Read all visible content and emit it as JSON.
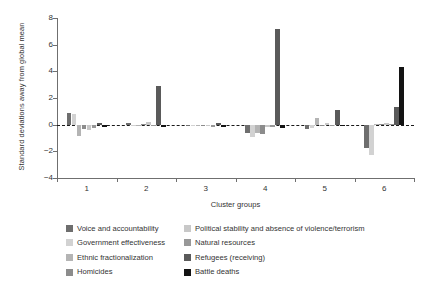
{
  "chart_data": {
    "type": "bar",
    "title": "",
    "xlabel": "Cluster groups",
    "ylabel": "Standard deviations away from global mean",
    "categories": [
      "1",
      "2",
      "3",
      "4",
      "5",
      "6"
    ],
    "ylim": [
      -4,
      8
    ],
    "yticks": [
      8,
      6,
      4,
      2,
      0,
      -2,
      -4
    ],
    "ytick_labels": [
      "8",
      "6",
      "4",
      "2",
      "0",
      "−2",
      "−4"
    ],
    "grid": false,
    "zero_reference_line": true,
    "legend_position": "below",
    "series": [
      {
        "name": "Voice and accountability",
        "color": "#6e6e6e",
        "values": [
          0.9,
          0.12,
          -0.12,
          -0.62,
          -0.36,
          -1.72
        ]
      },
      {
        "name": "Government effectiveness",
        "color": "#d2d2d2",
        "values": [
          0.78,
          -0.08,
          -0.1,
          -0.95,
          -0.22,
          -2.3
        ]
      },
      {
        "name": "Ethnic fractionalization",
        "color": "#b4b4b4",
        "values": [
          -0.82,
          -0.1,
          -0.06,
          -0.62,
          0.5,
          0.05
        ]
      },
      {
        "name": "Homicides",
        "color": "#8c8c8c",
        "values": [
          -0.3,
          0.05,
          -0.05,
          -0.7,
          -0.12,
          0.02
        ]
      },
      {
        "name": "Political stability and absence of violence/terrorism",
        "color": "#c8c8c8",
        "values": [
          -0.38,
          0.22,
          -0.08,
          -0.16,
          0.12,
          0.1
        ]
      },
      {
        "name": "Natural resources",
        "color": "#989898",
        "values": [
          -0.22,
          -0.06,
          -0.14,
          -0.18,
          -0.05,
          0.06
        ]
      },
      {
        "name": "Refugees (receiving)",
        "color": "#5a5a5a",
        "values": [
          0.14,
          2.9,
          0.16,
          7.2,
          1.1,
          1.3
        ]
      },
      {
        "name": "Battle deaths",
        "color": "#131313",
        "values": [
          -0.15,
          -0.14,
          -0.2,
          -0.25,
          -0.1,
          4.3
        ]
      }
    ]
  }
}
